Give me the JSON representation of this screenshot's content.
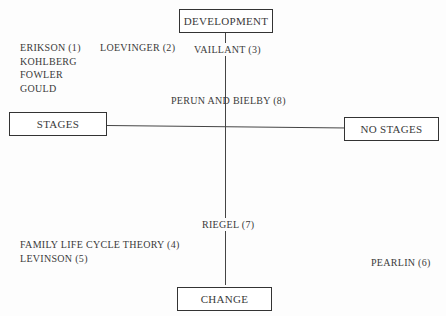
{
  "axes": {
    "top": "DEVELOPMENT",
    "bottom": "CHANGE",
    "left": "STAGES",
    "right": "NO STAGES"
  },
  "quadrants": {
    "top_left": [
      "ERIKSON (1)",
      "KOHLBERG",
      "FOWLER",
      "GOULD"
    ],
    "top_center": [
      "LOEVINGER (2)",
      "VAILLANT (3)"
    ],
    "center": "PERUN AND BIELBY (8)",
    "bottom_center": "RIEGEL (7)",
    "bottom_left": [
      "FAMILY LIFE CYCLE THEORY (4)",
      "LEVINSON (5)"
    ],
    "bottom_right": "PEARLIN (6)"
  }
}
